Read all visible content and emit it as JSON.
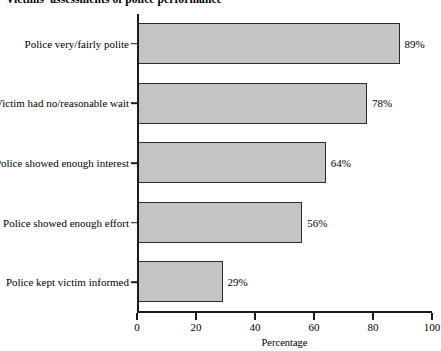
{
  "chart_data": {
    "type": "bar",
    "orientation": "horizontal",
    "title": "Victims' assessments of police performance",
    "xlabel": "Percentage",
    "ylabel": "",
    "xlim": [
      0,
      100
    ],
    "xticks": [
      "0",
      "20",
      "40",
      "60",
      "80",
      "100"
    ],
    "grid": false,
    "legend": null,
    "categories": [
      "Police very/fairly polite",
      "Victim had no/reasonable wait",
      "Police showed enough interest",
      "Police showed enough effort",
      "Police kept victim informed"
    ],
    "values": [
      89,
      78,
      64,
      56,
      29
    ],
    "data_labels": [
      "89%",
      "78%",
      "64%",
      "56%",
      "29%"
    ],
    "bar_fill_color": "#c4c4c4",
    "bar_edge_color": "#2a2a2a",
    "axis_color": "#1a1a1a"
  }
}
